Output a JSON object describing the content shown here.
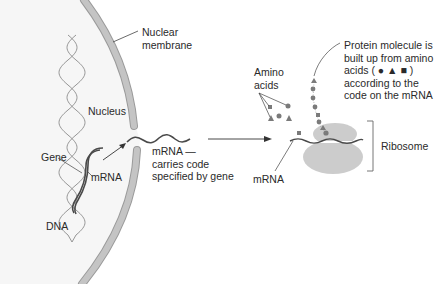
{
  "diagram": {
    "colors": {
      "nucleus_fill": "#f6f6f6",
      "membrane": "#bdbdbd",
      "membrane_edge": "#9a9a9a",
      "dna": "#8a8a8a",
      "mrna": "#5a5a5a",
      "ribosome": "#cccccc",
      "amino_acid": "#7a7a7a",
      "line": "#444444",
      "text": "#2a2a2a"
    },
    "labels": {
      "nuclear_membrane": [
        "Nuclear",
        "membrane"
      ],
      "nucleus": "Nucleus",
      "gene": "Gene",
      "mrna_nucleus": "mRNA",
      "dna": "DNA",
      "mrna_carries": [
        "mRNA —",
        "carries code",
        "specified by gene"
      ],
      "amino_acids": [
        "Amino",
        "acids"
      ],
      "protein": [
        "Protein molecule is",
        "built up from amino",
        "acids ( ● ▲ ■ )",
        "according to the",
        "code on the mRNA"
      ],
      "ribosome": "Ribosome",
      "mrna_ribosome": "mRNA"
    },
    "amino_acid_symbols": [
      "circle",
      "triangle",
      "square"
    ]
  }
}
